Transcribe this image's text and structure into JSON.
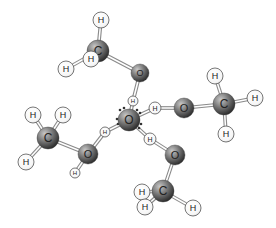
{
  "diagram": {
    "type": "molecular-cluster",
    "colors": {
      "background": "#ffffff",
      "heavy_atom_light": "#9a9a9a",
      "heavy_atom_dark": "#2e2e2e",
      "hydrogen_fill": "#ffffff",
      "hydrogen_stroke": "#555555",
      "bond": "#8a8a8a",
      "label": "#222222",
      "lone_pair": "#333333"
    },
    "atoms": [
      {
        "id": "o_center",
        "element": "O",
        "label": "O",
        "x": 129,
        "y": 120,
        "r": 11
      },
      {
        "id": "h_c_top",
        "element": "H",
        "label": "H",
        "x": 133,
        "y": 101,
        "r": 5
      },
      {
        "id": "h_c_right",
        "element": "H",
        "label": "H",
        "x": 155,
        "y": 108,
        "r": 6
      },
      {
        "id": "h_c_left",
        "element": "H",
        "label": "H",
        "x": 105,
        "y": 132,
        "r": 5
      },
      {
        "id": "h_c_bottom",
        "element": "H",
        "label": "H",
        "x": 150,
        "y": 139,
        "r": 6
      },
      {
        "id": "o_top",
        "element": "O",
        "label": "O",
        "x": 140,
        "y": 73,
        "r": 9
      },
      {
        "id": "c_top",
        "element": "C",
        "label": "C",
        "x": 98,
        "y": 51,
        "r": 11
      },
      {
        "id": "h_top_up",
        "element": "H",
        "label": "H",
        "x": 101,
        "y": 20,
        "r": 8
      },
      {
        "id": "h_top_left",
        "element": "H",
        "label": "H",
        "x": 66,
        "y": 69,
        "r": 8
      },
      {
        "id": "h_top_front",
        "element": "H",
        "label": "H",
        "x": 91,
        "y": 59,
        "r": 8
      },
      {
        "id": "o_right",
        "element": "O",
        "label": "O",
        "x": 184,
        "y": 108,
        "r": 10
      },
      {
        "id": "c_right",
        "element": "C",
        "label": "C",
        "x": 224,
        "y": 104,
        "r": 11
      },
      {
        "id": "h_right_up",
        "element": "H",
        "label": "H",
        "x": 215,
        "y": 76,
        "r": 8
      },
      {
        "id": "h_right_right",
        "element": "H",
        "label": "H",
        "x": 255,
        "y": 98,
        "r": 8
      },
      {
        "id": "h_right_down",
        "element": "H",
        "label": "H",
        "x": 226,
        "y": 134,
        "r": 8
      },
      {
        "id": "o_left",
        "element": "O",
        "label": "O",
        "x": 88,
        "y": 154,
        "r": 10
      },
      {
        "id": "h_left_oh",
        "element": "H",
        "label": "H",
        "x": 75,
        "y": 173,
        "r": 5
      },
      {
        "id": "c_left",
        "element": "C",
        "label": "C",
        "x": 48,
        "y": 138,
        "r": 11
      },
      {
        "id": "h_left_ul",
        "element": "H",
        "label": "H",
        "x": 33,
        "y": 115,
        "r": 8
      },
      {
        "id": "h_left_ur",
        "element": "H",
        "label": "H",
        "x": 63,
        "y": 115,
        "r": 8
      },
      {
        "id": "h_left_down",
        "element": "H",
        "label": "H",
        "x": 26,
        "y": 162,
        "r": 8
      },
      {
        "id": "o_bottom",
        "element": "O",
        "label": "O",
        "x": 175,
        "y": 155,
        "r": 10
      },
      {
        "id": "c_bottom",
        "element": "C",
        "label": "C",
        "x": 163,
        "y": 191,
        "r": 11
      },
      {
        "id": "h_bottom_left",
        "element": "H",
        "label": "H",
        "x": 142,
        "y": 192,
        "r": 8
      },
      {
        "id": "h_bottom_front",
        "element": "H",
        "label": "H",
        "x": 145,
        "y": 207,
        "r": 8
      },
      {
        "id": "h_bottom_right",
        "element": "H",
        "label": "H",
        "x": 193,
        "y": 208,
        "r": 8
      }
    ],
    "bonds": [
      {
        "from": "o_center",
        "to": "h_c_top"
      },
      {
        "from": "o_center",
        "to": "h_c_right"
      },
      {
        "from": "o_center",
        "to": "h_c_left"
      },
      {
        "from": "o_center",
        "to": "h_c_bottom"
      },
      {
        "from": "h_c_top",
        "to": "o_top"
      },
      {
        "from": "o_top",
        "to": "c_top"
      },
      {
        "from": "c_top",
        "to": "h_top_up"
      },
      {
        "from": "c_top",
        "to": "h_top_left"
      },
      {
        "from": "h_c_right",
        "to": "o_right"
      },
      {
        "from": "o_right",
        "to": "c_right"
      },
      {
        "from": "c_right",
        "to": "h_right_up"
      },
      {
        "from": "c_right",
        "to": "h_right_right"
      },
      {
        "from": "c_right",
        "to": "h_right_down"
      },
      {
        "from": "h_c_left",
        "to": "o_left"
      },
      {
        "from": "o_left",
        "to": "h_left_oh"
      },
      {
        "from": "o_left",
        "to": "c_left"
      },
      {
        "from": "c_left",
        "to": "h_left_ul"
      },
      {
        "from": "c_left",
        "to": "h_left_ur"
      },
      {
        "from": "c_left",
        "to": "h_left_down"
      },
      {
        "from": "h_c_bottom",
        "to": "o_bottom"
      },
      {
        "from": "o_bottom",
        "to": "c_bottom"
      },
      {
        "from": "c_bottom",
        "to": "h_bottom_left"
      },
      {
        "from": "c_bottom",
        "to": "h_bottom_front"
      },
      {
        "from": "c_bottom",
        "to": "h_bottom_right"
      }
    ],
    "lone_pair_dots": [
      {
        "x": 120,
        "y": 110
      },
      {
        "x": 124,
        "y": 108
      },
      {
        "x": 137,
        "y": 110
      },
      {
        "x": 140,
        "y": 113
      },
      {
        "x": 141,
        "y": 124
      },
      {
        "x": 139,
        "y": 128
      },
      {
        "x": 117,
        "y": 119
      },
      {
        "x": 118,
        "y": 124
      }
    ]
  }
}
